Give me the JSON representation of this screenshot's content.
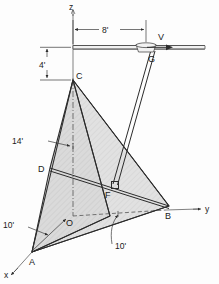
{
  "figure": {
    "type": "engineering-diagram"
  },
  "axes": [
    {
      "id": "z",
      "label": "z"
    },
    {
      "id": "y",
      "label": "y"
    },
    {
      "id": "x",
      "label": "x"
    }
  ],
  "points": [
    {
      "id": "O",
      "label": "O"
    },
    {
      "id": "A",
      "label": "A"
    },
    {
      "id": "B",
      "label": "B"
    },
    {
      "id": "C",
      "label": "C"
    },
    {
      "id": "D",
      "label": "D"
    },
    {
      "id": "F",
      "label": "F"
    },
    {
      "id": "G",
      "label": "G"
    }
  ],
  "dimensions": [
    {
      "id": "horizontal-boom",
      "value": "8'"
    },
    {
      "id": "mast-drop",
      "value": "4'"
    },
    {
      "id": "pole-height",
      "value": "14'"
    },
    {
      "id": "x-offset",
      "value": "10'"
    },
    {
      "id": "y-offset",
      "value": "10'"
    }
  ],
  "force": {
    "label": "V"
  },
  "colors": {
    "plate_fill": "#d8d8d8",
    "line": "#2b2b2b",
    "dash": "#555555"
  }
}
